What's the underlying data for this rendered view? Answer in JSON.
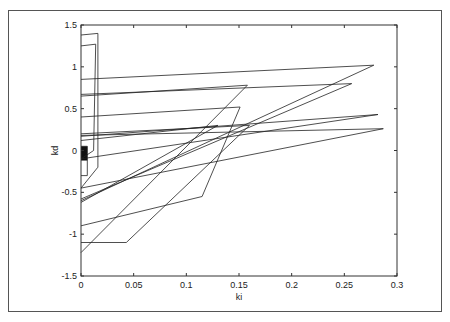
{
  "chart_data": {
    "type": "line",
    "title": "",
    "xlabel": "ki",
    "ylabel": "kd",
    "xlim": [
      0,
      0.3
    ],
    "ylim": [
      -1.5,
      1.5
    ],
    "grid": false,
    "legend": null,
    "x_ticks": [
      "0",
      "0.05",
      "0.1",
      "0.15",
      "0.2",
      "0.25",
      "0.3"
    ],
    "x_tick_values": [
      0,
      0.05,
      0.1,
      0.15,
      0.2,
      0.25,
      0.3
    ],
    "y_ticks": [
      "1.5",
      "1",
      "0.5",
      "0",
      "-0.5",
      "-1",
      "-1.5"
    ],
    "y_tick_values": [
      1.5,
      1,
      0.5,
      0,
      -0.5,
      -1,
      -1.5
    ],
    "series": [
      {
        "name": "boundary-1",
        "x": [
          0.0,
          0.016,
          0.016,
          0.0
        ],
        "y": [
          1.38,
          1.4,
          -0.2,
          -0.45
        ]
      },
      {
        "name": "boundary-2",
        "x": [
          0.0,
          0.014,
          0.012,
          0.0
        ],
        "y": [
          1.25,
          1.27,
          0.0,
          -0.1
        ]
      },
      {
        "name": "edge-top",
        "x": [
          0.0,
          0.278,
          0.0
        ],
        "y": [
          0.85,
          1.02,
          -0.6
        ]
      },
      {
        "name": "edge-2",
        "x": [
          0.0,
          0.257,
          0.0
        ],
        "y": [
          0.67,
          0.8,
          -0.58
        ]
      },
      {
        "name": "edge-3",
        "x": [
          0.0,
          0.158,
          0.0
        ],
        "y": [
          0.65,
          0.78,
          -1.22
        ]
      },
      {
        "name": "edge-4",
        "x": [
          0.0,
          0.151,
          0.115,
          0.0
        ],
        "y": [
          0.4,
          0.52,
          -0.55,
          -0.9
        ]
      },
      {
        "name": "edge-5",
        "x": [
          0.0,
          0.282,
          0.0
        ],
        "y": [
          0.17,
          0.43,
          -0.1
        ]
      },
      {
        "name": "edge-6",
        "x": [
          0.0,
          0.287,
          0.0
        ],
        "y": [
          0.18,
          0.26,
          -0.45
        ]
      },
      {
        "name": "edge-7",
        "x": [
          0.0,
          0.16,
          0.043,
          0.0
        ],
        "y": [
          0.2,
          0.3,
          -1.1,
          -1.1
        ]
      },
      {
        "name": "edge-8",
        "x": [
          0.0,
          0.13,
          0.0
        ],
        "y": [
          0.12,
          0.3,
          -0.62
        ]
      },
      {
        "name": "inner-box",
        "x": [
          0.0,
          0.006,
          0.006,
          0.0
        ],
        "y": [
          0.05,
          0.05,
          -0.3,
          -0.3
        ]
      }
    ],
    "filled_region": {
      "x": [
        0.0,
        0.006
      ],
      "y": [
        -0.12,
        0.05
      ]
    }
  }
}
